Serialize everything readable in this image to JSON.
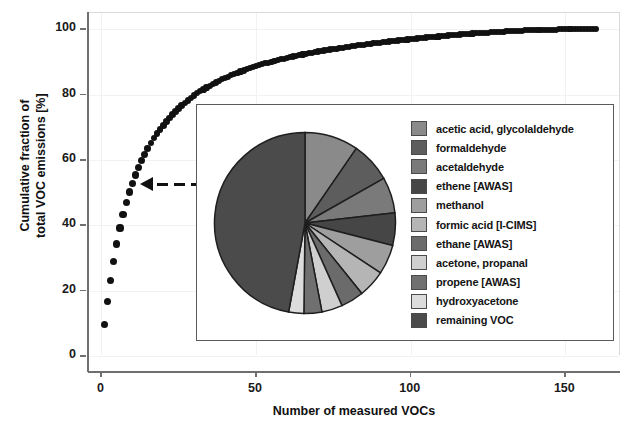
{
  "chart_data": {
    "type": "scatter",
    "title": "",
    "xlabel": "Number of measured VOCs",
    "ylabel": "Cumulative fraction of total VOC emissions [%]",
    "xlim": [
      -4,
      168
    ],
    "ylim": [
      0,
      105
    ],
    "xticks": [
      0,
      50,
      100,
      150
    ],
    "yticks": [
      0,
      20,
      40,
      60,
      80,
      100
    ],
    "grid": true,
    "legend_position": "inset-right",
    "marker": "filled-circle",
    "marker_color": "#111111",
    "x": [
      1,
      2,
      3,
      4,
      5,
      6,
      7,
      8,
      9,
      10,
      11,
      12,
      13,
      14,
      15,
      16,
      17,
      18,
      19,
      20,
      21,
      22,
      23,
      24,
      25,
      26,
      27,
      28,
      29,
      30,
      31,
      32,
      33,
      34,
      35,
      36,
      37,
      38,
      39,
      40,
      41,
      42,
      43,
      44,
      45,
      46,
      47,
      48,
      49,
      50,
      51,
      52,
      53,
      54,
      55,
      56,
      57,
      58,
      59,
      60,
      61,
      62,
      63,
      64,
      65,
      66,
      67,
      68,
      69,
      70,
      71,
      72,
      73,
      74,
      75,
      76,
      77,
      78,
      79,
      80,
      81,
      82,
      83,
      84,
      85,
      86,
      87,
      88,
      89,
      90,
      91,
      92,
      93,
      94,
      95,
      96,
      97,
      98,
      99,
      100,
      101,
      102,
      103,
      104,
      105,
      106,
      107,
      108,
      109,
      110,
      111,
      112,
      113,
      114,
      115,
      116,
      117,
      118,
      119,
      120,
      121,
      122,
      123,
      124,
      125,
      126,
      127,
      128,
      129,
      130,
      131,
      132,
      133,
      134,
      135,
      136,
      137,
      138,
      139,
      140,
      141,
      142,
      143,
      144,
      145,
      146,
      147,
      148,
      149,
      150,
      151,
      152,
      153,
      154,
      155,
      156,
      157,
      158,
      159,
      160
    ],
    "y": [
      9.6,
      16.8,
      23.2,
      29.0,
      34.3,
      39.2,
      43.3,
      47.0,
      50.2,
      52.9,
      55.4,
      57.7,
      59.8,
      61.7,
      63.5,
      65.2,
      66.7,
      68.1,
      69.4,
      70.6,
      71.8,
      72.9,
      73.9,
      74.9,
      75.8,
      76.7,
      77.5,
      78.3,
      79.0,
      79.7,
      80.4,
      81.0,
      81.6,
      82.2,
      82.7,
      83.2,
      83.7,
      84.2,
      84.7,
      85.1,
      85.5,
      85.9,
      86.3,
      86.7,
      87.1,
      87.4,
      87.8,
      88.1,
      88.4,
      88.7,
      89.0,
      89.3,
      89.6,
      89.8,
      90.1,
      90.3,
      90.6,
      90.8,
      91.0,
      91.3,
      91.5,
      91.7,
      91.9,
      92.1,
      92.3,
      92.5,
      92.7,
      92.8,
      93.0,
      93.2,
      93.4,
      93.5,
      93.7,
      93.8,
      94.0,
      94.1,
      94.3,
      94.4,
      94.6,
      94.7,
      94.8,
      95.0,
      95.1,
      95.2,
      95.3,
      95.5,
      95.6,
      95.7,
      95.8,
      95.9,
      96.0,
      96.2,
      96.3,
      96.4,
      96.5,
      96.6,
      96.7,
      96.8,
      96.9,
      97.0,
      97.1,
      97.2,
      97.3,
      97.4,
      97.5,
      97.6,
      97.6,
      97.7,
      97.8,
      97.9,
      98.0,
      98.1,
      98.2,
      98.2,
      98.3,
      98.4,
      98.5,
      98.5,
      98.6,
      98.7,
      98.8,
      98.8,
      98.9,
      99.0,
      99.0,
      99.1,
      99.1,
      99.2,
      99.3,
      99.3,
      99.4,
      99.4,
      99.5,
      99.5,
      99.6,
      99.6,
      99.7,
      99.7,
      99.7,
      99.8,
      99.8,
      99.8,
      99.9,
      99.9,
      99.9,
      99.9,
      99.9,
      100.0,
      100.0,
      100.0,
      100.0,
      100.0,
      100.0,
      100.0,
      100.0,
      100.0,
      100.0,
      100.0,
      100.0,
      100.0
    ]
  },
  "inset_chart": {
    "type": "pie",
    "title": "",
    "start_angle_deg": 0,
    "direction": "clockwise",
    "slices": [
      {
        "label": "acetic acid, glycolaldehyde",
        "value": 9.6,
        "color": "#8a8a8a"
      },
      {
        "label": "formaldehyde",
        "value": 7.2,
        "color": "#5d5d5d"
      },
      {
        "label": "acetaldehyde",
        "value": 6.4,
        "color": "#7a7a7a"
      },
      {
        "label": "ethene [AWAS]",
        "value": 5.8,
        "color": "#464646"
      },
      {
        "label": "methanol",
        "value": 5.3,
        "color": "#9e9e9e"
      },
      {
        "label": "formic acid [I-CIMS]",
        "value": 4.9,
        "color": "#b5b5b5"
      },
      {
        "label": "ethane [AWAS]",
        "value": 4.1,
        "color": "#6b6b6b"
      },
      {
        "label": "acetone, propanal",
        "value": 3.7,
        "color": "#cfcfcf"
      },
      {
        "label": "propene [AWAS]",
        "value": 3.2,
        "color": "#707070"
      },
      {
        "label": "hydroxyacetone",
        "value": 2.7,
        "color": "#dcdcdc"
      },
      {
        "label": "remaining VOC",
        "value": 47.1,
        "color": "#4b4b4b"
      }
    ]
  },
  "axes": {
    "x_title": "Number of measured VOCs",
    "y_title": "Cumulative fraction of\ntotal VOC emissions [%]",
    "y_title_line1": "Cumulative fraction of",
    "y_title_line2": "total VOC emissions [%]",
    "x_tick_labels": [
      "0",
      "50",
      "100",
      "150"
    ],
    "y_tick_labels": [
      "0",
      "20",
      "40",
      "60",
      "80",
      "100"
    ]
  },
  "annotation": {
    "arrow_name": "callout-arrow",
    "style": "dashed-line-with-left-triangle",
    "color": "#111111"
  },
  "colors": {
    "marker": "#111111",
    "axis": "#6f6f6f",
    "gridline": "#f2f2f2",
    "inset_border": "#5a5a5a",
    "text": "#111111",
    "background": "#ffffff"
  }
}
